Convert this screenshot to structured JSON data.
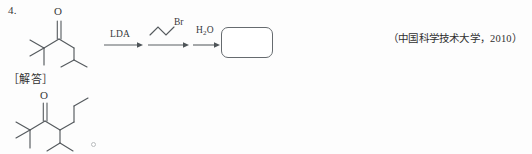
{
  "page": {
    "background_color": "#fdfdfd",
    "ink_color": "#555a5e"
  },
  "problem": {
    "number": "4.",
    "citation": "（中国科学技术大学，2010）"
  },
  "reaction": {
    "substrate": {
      "name": "2,2,5-trimethylhexan-3-one",
      "carbonyl_label": "O"
    },
    "steps": [
      {
        "id": "step-1",
        "reagent_label": "LDA",
        "reagent_name": "lithium-diisopropylamide"
      },
      {
        "id": "step-2",
        "reagent_label": "",
        "reagent_name": "n-propyl-bromide",
        "halogen_label": "Br"
      },
      {
        "id": "step-3",
        "reagent_label": "H",
        "reagent_sub": "2",
        "reagent_label_tail": "O",
        "reagent_name": "water"
      }
    ],
    "product_placeholder": {
      "name": "answer-box",
      "content": ""
    }
  },
  "answer": {
    "label": "［解答］",
    "product": {
      "name": "2,2-dimethyl-4-isopropylheptan-3-one",
      "carbonyl_label": "O"
    }
  }
}
